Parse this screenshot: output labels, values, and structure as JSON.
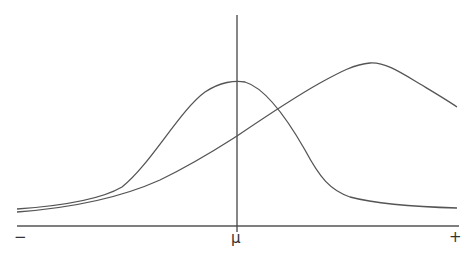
{
  "diagram": {
    "type": "distribution-curves",
    "axis": {
      "left_label": "−",
      "center_label": "μ",
      "right_label": "+"
    },
    "stroke_color": "#555555",
    "curves": [
      {
        "name": "narrow-symmetric-curve",
        "peak_x_label": "μ"
      },
      {
        "name": "wide-skewed-curve",
        "peak_position": "right of μ"
      }
    ]
  }
}
